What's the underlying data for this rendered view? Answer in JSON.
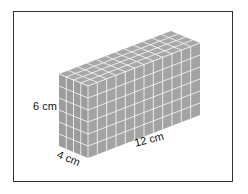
{
  "figure": {
    "dimensions": {
      "height_label": "6 cm",
      "depth_label": "4 cm",
      "length_label": "12 cm"
    },
    "cube_counts": {
      "length": 12,
      "depth": 4,
      "height": 6
    },
    "colors": {
      "cube_fill": "#a3a3a3",
      "grid_line": "#f2f2f2",
      "frame": "#333333"
    }
  }
}
